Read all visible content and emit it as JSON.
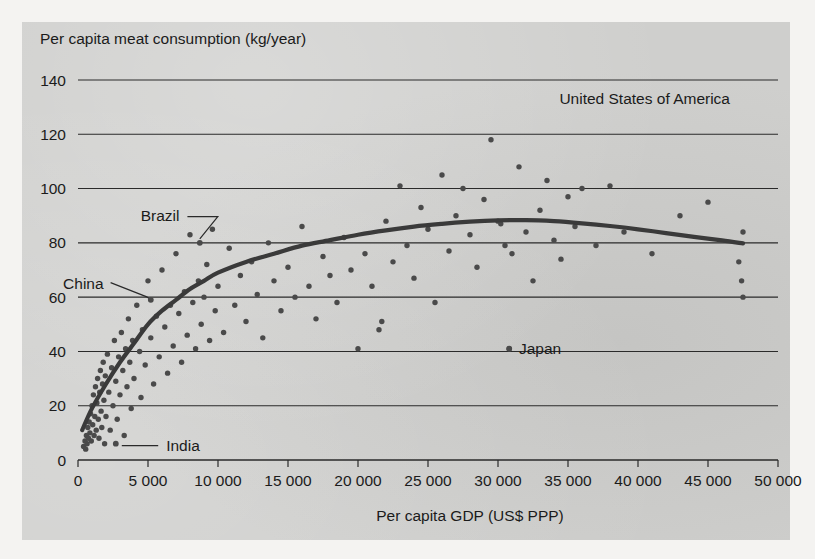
{
  "chart_data": {
    "type": "scatter",
    "title": "",
    "ylabel": "Per capita meat consumption (kg/year)",
    "xlabel": "Per capita GDP (US$ PPP)",
    "xlim": [
      0,
      50000
    ],
    "ylim": [
      0,
      140
    ],
    "xticks": [
      0,
      5000,
      10000,
      15000,
      20000,
      25000,
      30000,
      35000,
      40000,
      45000,
      50000
    ],
    "xtick_labels": [
      "0",
      "5 000",
      "10 000",
      "15 000",
      "20 000",
      "25 000",
      "30 000",
      "35 000",
      "40 000",
      "45 000",
      "50 000"
    ],
    "yticks": [
      0,
      20,
      40,
      60,
      80,
      100,
      120,
      140
    ],
    "ytick_labels": [
      "0",
      "20",
      "40",
      "60",
      "80",
      "100",
      "120",
      "140"
    ],
    "grid": "horizontal",
    "legend": "none",
    "series": [
      {
        "name": "Countries",
        "marker": "dot",
        "color": "#4a4a4a",
        "points": [
          [
            400,
            5
          ],
          [
            500,
            7
          ],
          [
            550,
            4
          ],
          [
            600,
            9
          ],
          [
            650,
            6
          ],
          [
            700,
            12
          ],
          [
            750,
            8
          ],
          [
            800,
            14
          ],
          [
            850,
            10
          ],
          [
            900,
            17
          ],
          [
            950,
            7
          ],
          [
            1000,
            20
          ],
          [
            1050,
            13
          ],
          [
            1100,
            24
          ],
          [
            1150,
            9
          ],
          [
            1200,
            16
          ],
          [
            1250,
            27
          ],
          [
            1300,
            11
          ],
          [
            1350,
            21
          ],
          [
            1400,
            30
          ],
          [
            1450,
            15
          ],
          [
            1500,
            8
          ],
          [
            1550,
            25
          ],
          [
            1600,
            33
          ],
          [
            1650,
            18
          ],
          [
            1700,
            12
          ],
          [
            1750,
            28
          ],
          [
            1800,
            36
          ],
          [
            1850,
            22
          ],
          [
            1900,
            6
          ],
          [
            1950,
            31
          ],
          [
            2000,
            16
          ],
          [
            2100,
            39
          ],
          [
            2200,
            25
          ],
          [
            2300,
            11
          ],
          [
            2400,
            34
          ],
          [
            2500,
            20
          ],
          [
            2600,
            44
          ],
          [
            2700,
            29
          ],
          [
            2800,
            15
          ],
          [
            2900,
            38
          ],
          [
            3000,
            24
          ],
          [
            3100,
            47
          ],
          [
            3200,
            33
          ],
          [
            3300,
            9
          ],
          [
            3400,
            41
          ],
          [
            3500,
            27
          ],
          [
            3600,
            52
          ],
          [
            3700,
            36
          ],
          [
            3800,
            19
          ],
          [
            3900,
            44
          ],
          [
            4000,
            30
          ],
          [
            4200,
            57
          ],
          [
            4400,
            40
          ],
          [
            4500,
            23
          ],
          [
            4600,
            48
          ],
          [
            4800,
            35
          ],
          [
            5000,
            66
          ],
          [
            5200,
            45
          ],
          [
            5400,
            28
          ],
          [
            5600,
            53
          ],
          [
            5800,
            38
          ],
          [
            6000,
            70
          ],
          [
            6200,
            49
          ],
          [
            6400,
            32
          ],
          [
            6600,
            57
          ],
          [
            6800,
            42
          ],
          [
            7000,
            76
          ],
          [
            7200,
            54
          ],
          [
            7400,
            36
          ],
          [
            7600,
            62
          ],
          [
            7800,
            46
          ],
          [
            8000,
            83
          ],
          [
            8200,
            58
          ],
          [
            8400,
            41
          ],
          [
            8600,
            66
          ],
          [
            8800,
            50
          ],
          [
            9000,
            60
          ],
          [
            9200,
            72
          ],
          [
            9400,
            44
          ],
          [
            9600,
            85
          ],
          [
            9800,
            55
          ],
          [
            10000,
            64
          ],
          [
            10400,
            47
          ],
          [
            10800,
            78
          ],
          [
            11200,
            57
          ],
          [
            11600,
            68
          ],
          [
            12000,
            51
          ],
          [
            12400,
            73
          ],
          [
            12800,
            61
          ],
          [
            13200,
            45
          ],
          [
            13600,
            80
          ],
          [
            14000,
            66
          ],
          [
            14500,
            55
          ],
          [
            15000,
            71
          ],
          [
            15500,
            60
          ],
          [
            16000,
            86
          ],
          [
            16500,
            64
          ],
          [
            17000,
            52
          ],
          [
            17500,
            75
          ],
          [
            18000,
            68
          ],
          [
            18500,
            58
          ],
          [
            19000,
            82
          ],
          [
            19500,
            70
          ],
          [
            20000,
            41
          ],
          [
            20500,
            76
          ],
          [
            21000,
            64
          ],
          [
            21500,
            48
          ],
          [
            21700,
            51
          ],
          [
            22000,
            88
          ],
          [
            22500,
            73
          ],
          [
            23000,
            101
          ],
          [
            23500,
            79
          ],
          [
            24000,
            67
          ],
          [
            24500,
            93
          ],
          [
            25000,
            85
          ],
          [
            25500,
            58
          ],
          [
            26000,
            105
          ],
          [
            26500,
            77
          ],
          [
            27000,
            90
          ],
          [
            27500,
            100
          ],
          [
            28000,
            83
          ],
          [
            28500,
            71
          ],
          [
            29000,
            96
          ],
          [
            29500,
            118
          ],
          [
            30000,
            88
          ],
          [
            30200,
            87
          ],
          [
            30500,
            79
          ],
          [
            30800,
            41
          ],
          [
            31000,
            76
          ],
          [
            31500,
            108
          ],
          [
            32000,
            84
          ],
          [
            32500,
            66
          ],
          [
            33000,
            92
          ],
          [
            33500,
            103
          ],
          [
            34000,
            81
          ],
          [
            34500,
            74
          ],
          [
            35000,
            97
          ],
          [
            35500,
            86
          ],
          [
            36000,
            100
          ],
          [
            37000,
            79
          ],
          [
            38000,
            101
          ],
          [
            39000,
            84
          ],
          [
            41000,
            76
          ],
          [
            43000,
            90
          ],
          [
            45000,
            95
          ],
          [
            47200,
            73
          ],
          [
            47400,
            66
          ],
          [
            47500,
            60
          ],
          [
            47500,
            84
          ]
        ]
      }
    ],
    "trend_line": {
      "name": "fitted curve",
      "color": "#3a3a3a",
      "points": [
        [
          300,
          11
        ],
        [
          1000,
          19
        ],
        [
          2000,
          28
        ],
        [
          3000,
          36
        ],
        [
          4000,
          43
        ],
        [
          5000,
          50
        ],
        [
          6000,
          55
        ],
        [
          7000,
          59
        ],
        [
          8000,
          63
        ],
        [
          9000,
          66
        ],
        [
          10000,
          69
        ],
        [
          12000,
          73
        ],
        [
          14000,
          76
        ],
        [
          16000,
          79
        ],
        [
          18000,
          81
        ],
        [
          20000,
          83
        ],
        [
          22000,
          84.6
        ],
        [
          24000,
          86
        ],
        [
          26000,
          87
        ],
        [
          28000,
          87.8
        ],
        [
          30000,
          88.3
        ],
        [
          32000,
          88.4
        ],
        [
          34000,
          88
        ],
        [
          36000,
          87.2
        ],
        [
          38000,
          86.2
        ],
        [
          40000,
          85
        ],
        [
          42000,
          83.6
        ],
        [
          44000,
          82.2
        ],
        [
          46000,
          80.9
        ],
        [
          47500,
          79.8
        ]
      ]
    },
    "annotations": [
      {
        "label": "United States of America",
        "kind": "text-only",
        "x": 30000,
        "y": 131
      },
      {
        "label": "Brazil",
        "kind": "leader",
        "label_x": 8100,
        "label_y": 90,
        "point_x": 8700,
        "point_y": 80
      },
      {
        "label": "China",
        "kind": "leader",
        "label_x": 2400,
        "label_y": 65,
        "point_x": 5200,
        "point_y": 59
      },
      {
        "label": "India",
        "kind": "leader",
        "label_x": 6300,
        "label_y": 5,
        "point_x": 2700,
        "point_y": 6
      },
      {
        "label": "Japan",
        "kind": "dot-left",
        "label_x": 31500,
        "label_y": 41,
        "point_x": 30800,
        "point_y": 41
      }
    ]
  }
}
